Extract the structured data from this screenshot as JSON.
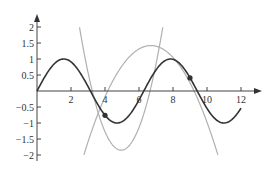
{
  "chart_data": {
    "type": "line",
    "title": "",
    "xlabel": "",
    "ylabel": "",
    "xlim": [
      0,
      13
    ],
    "ylim": [
      -2.2,
      2.3
    ],
    "grid": false,
    "legend": null,
    "x_ticks": [
      2,
      4,
      6,
      8,
      10,
      12
    ],
    "x_tick_labels": [
      "2",
      "4",
      "6",
      "8",
      "10",
      "12"
    ],
    "y_ticks": [
      2,
      1.5,
      1,
      0.5,
      -0.5,
      -1,
      -1.5,
      -2
    ],
    "y_tick_labels": [
      "2",
      "1.5",
      "1",
      "0.5",
      "−0.5",
      "−1",
      "−1.5",
      "−2"
    ],
    "series": [
      {
        "name": "sin(x)",
        "color": "#333333",
        "kind": "function",
        "formula": "sin(x)",
        "x_range": [
          0,
          12
        ],
        "sample_points": [
          [
            0,
            0
          ],
          [
            1.57,
            1
          ],
          [
            3.14,
            0
          ],
          [
            4,
            -0.76
          ],
          [
            4.71,
            -1
          ],
          [
            6.28,
            0
          ],
          [
            7.85,
            1
          ],
          [
            9,
            0.41
          ],
          [
            9.42,
            0
          ],
          [
            10.99,
            -1
          ],
          [
            12,
            -0.54
          ]
        ]
      },
      {
        "name": "downward parabola approximation",
        "color": "#b0b0b0",
        "kind": "parabola",
        "vertex": [
          6.7,
          1.42
        ],
        "a": -0.22,
        "x_range": [
          2.76,
          10.64
        ]
      },
      {
        "name": "upward parabola approximation",
        "color": "#b0b0b0",
        "kind": "parabola",
        "vertex": [
          4.95,
          -1.85
        ],
        "a": 0.64,
        "x_range": [
          2.5,
          7.4
        ]
      }
    ],
    "points": [
      {
        "x": 4,
        "y": -0.76,
        "color": "#333333"
      },
      {
        "x": 9,
        "y": 0.41,
        "color": "#333333"
      }
    ]
  }
}
